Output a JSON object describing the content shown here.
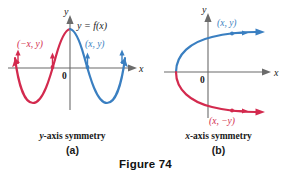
{
  "figure": {
    "caption": "Figure 74",
    "colors": {
      "red": "#d32a4e",
      "blue": "#3a7fc1",
      "axis": "#6b6b6b",
      "text": "#1a1a1a"
    }
  },
  "panel_a": {
    "letter": "(a)",
    "symmetry_label_italic": "y",
    "symmetry_label_rest": "-axis symmetry",
    "axis_x_label": "x",
    "axis_y_label": "y",
    "origin_label": "0",
    "function_label": "y = f(x)",
    "point_left_label": "(−x, y)",
    "point_right_label": "(x, y)",
    "curve_description": "sine-like wave, even symmetry about the y-axis; left half red, right half blue, both with arrowheads at the ends"
  },
  "panel_b": {
    "letter": "(b)",
    "symmetry_label_italic": "x",
    "symmetry_label_rest": "-axis symmetry",
    "axis_x_label": "x",
    "axis_y_label": "y",
    "origin_label": "0",
    "point_upper_label": "(x, y)",
    "point_lower_label": "(x, −y)",
    "curve_description": "sideways parabola opening right with vertex left of the y-axis on the x-axis; upper branch blue, lower branch red, both with arrowheads"
  }
}
